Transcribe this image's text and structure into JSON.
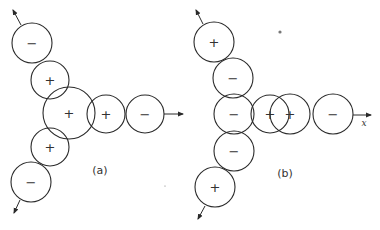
{
  "diagram": {
    "panels": [
      {
        "id": "a",
        "label": "(a)",
        "label_pos": [
          100,
          170
        ],
        "circles": [
          {
            "cx": 32,
            "cy": 43,
            "r": 20,
            "sign": "−"
          },
          {
            "cx": 50,
            "cy": 80,
            "r": 19,
            "sign": "+"
          },
          {
            "cx": 69,
            "cy": 113,
            "r": 26,
            "sign": "+"
          },
          {
            "cx": 106,
            "cy": 114,
            "r": 19,
            "sign": "+"
          },
          {
            "cx": 145,
            "cy": 114,
            "r": 19,
            "sign": "−"
          },
          {
            "cx": 50,
            "cy": 147,
            "r": 19,
            "sign": "+"
          },
          {
            "cx": 31,
            "cy": 182,
            "r": 20,
            "sign": "−"
          }
        ],
        "arrows": [
          {
            "x1": 21,
            "y1": 25,
            "x2": 13,
            "y2": 10
          },
          {
            "x1": 164,
            "y1": 114,
            "x2": 183,
            "y2": 114
          },
          {
            "x1": 20,
            "y1": 200,
            "x2": 14,
            "y2": 213
          }
        ]
      },
      {
        "id": "b",
        "label": "(b)",
        "label_pos": [
          285,
          173
        ],
        "axis_label": "x",
        "axis_label_pos": [
          364,
          126
        ],
        "circles": [
          {
            "cx": 214,
            "cy": 42,
            "r": 20,
            "sign": "+"
          },
          {
            "cx": 233,
            "cy": 78,
            "r": 20,
            "sign": "−"
          },
          {
            "cx": 234,
            "cy": 114,
            "r": 20,
            "sign": "−"
          },
          {
            "cx": 270,
            "cy": 114,
            "r": 19,
            "sign": "+"
          },
          {
            "cx": 290,
            "cy": 114,
            "r": 20,
            "sign": "+"
          },
          {
            "cx": 333,
            "cy": 114,
            "r": 20,
            "sign": "−"
          },
          {
            "cx": 234,
            "cy": 151,
            "r": 20,
            "sign": "−"
          },
          {
            "cx": 215,
            "cy": 187,
            "r": 20,
            "sign": "+"
          }
        ],
        "arrows": [
          {
            "x1": 203,
            "y1": 24,
            "x2": 196,
            "y2": 10
          },
          {
            "x1": 353,
            "y1": 115,
            "x2": 371,
            "y2": 115
          },
          {
            "x1": 205,
            "y1": 206,
            "x2": 198,
            "y2": 219
          }
        ]
      }
    ],
    "specks": [
      {
        "cx": 280,
        "cy": 32,
        "r": 1.6
      },
      {
        "cx": 165,
        "cy": 186,
        "r": 0.6
      }
    ]
  }
}
